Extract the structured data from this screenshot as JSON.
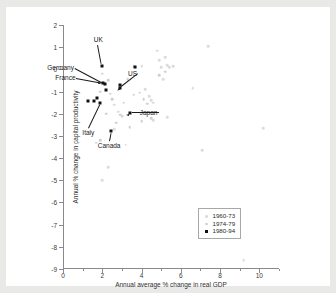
{
  "chart_data": {
    "type": "scatter",
    "title": "",
    "xlabel": "Annual average % change in real GDP",
    "ylabel": "Annual % change in capital productivity",
    "xlim": [
      0,
      11
    ],
    "ylim": [
      -9,
      2
    ],
    "xticks": [
      0,
      2,
      4,
      6,
      8,
      10
    ],
    "xticklabels": [
      "0",
      "2",
      "4",
      "6",
      "8",
      "10"
    ],
    "xminorticks": [
      1,
      3,
      5,
      7,
      9,
      11
    ],
    "yticks": [
      2,
      1,
      0,
      -1,
      -2,
      -3,
      -4,
      -5,
      -6,
      -7,
      -8,
      -9
    ],
    "yticklabels": [
      "2",
      "1",
      "0",
      "-1",
      "-2",
      "-3",
      "-4",
      "-5",
      "-6",
      "-7",
      "-8",
      "-9"
    ],
    "grid": false,
    "legend_position": "lower-right",
    "legend_entries": [
      "1960-73",
      "1974-79",
      "1980-94"
    ],
    "colors": {
      "series_1960_73": "#dcdcdc",
      "series_1974_79": "#cfcfcf",
      "series_1980_94": "#111111",
      "axis": "#8a8a8a",
      "page_background": "#e9e9e7",
      "plot_background": "#ffffff"
    },
    "series": [
      {
        "name": "1960-73",
        "marker": "circle-open-faint",
        "points": [
          [
            0.8,
            -3.3
          ],
          [
            1.7,
            -3.3
          ],
          [
            2.0,
            -5.0
          ],
          [
            2.3,
            -4.4
          ],
          [
            2.6,
            -2.7
          ],
          [
            2.0,
            -0.2
          ],
          [
            2.4,
            -1.1
          ],
          [
            2.6,
            -1.6
          ],
          [
            2.8,
            -1.9
          ],
          [
            3.0,
            -2.1
          ],
          [
            3.2,
            -3.4
          ],
          [
            3.6,
            0.15
          ],
          [
            3.7,
            0.1
          ],
          [
            4.0,
            0.15
          ],
          [
            4.4,
            -1.2
          ],
          [
            4.2,
            -0.9
          ],
          [
            4.5,
            -1.4
          ],
          [
            4.6,
            -1.5
          ],
          [
            4.8,
            0.85
          ],
          [
            4.9,
            0.4
          ],
          [
            5.0,
            0.1
          ],
          [
            5.2,
            0.55
          ],
          [
            5.3,
            0.2
          ],
          [
            5.4,
            0.1
          ],
          [
            5.6,
            0.15
          ],
          [
            5.1,
            -0.45
          ],
          [
            5.3,
            -2.15
          ],
          [
            4.6,
            -2.3
          ],
          [
            6.6,
            -0.85
          ],
          [
            7.4,
            1.05
          ],
          [
            7.1,
            -3.65
          ],
          [
            9.2,
            -8.6
          ],
          [
            10.2,
            -2.65
          ]
        ]
      },
      {
        "name": "1974-79",
        "marker": "circle-open-light",
        "points": [
          [
            1.9,
            -3.2
          ],
          [
            2.2,
            -2.0
          ],
          [
            2.5,
            -1.35
          ],
          [
            2.7,
            -2.4
          ],
          [
            2.9,
            -2.05
          ],
          [
            3.1,
            -1.5
          ],
          [
            3.3,
            -0.45
          ],
          [
            3.6,
            -1.15
          ],
          [
            3.9,
            -1.05
          ],
          [
            4.1,
            -1.35
          ],
          [
            4.3,
            -1.55
          ],
          [
            4.0,
            -2.35
          ],
          [
            4.5,
            -2.2
          ],
          [
            4.9,
            -0.25
          ],
          [
            5.2,
            -0.1
          ],
          [
            3.4,
            -2.6
          ],
          [
            2.3,
            -0.5
          ],
          [
            1.9,
            -1.0
          ]
        ]
      },
      {
        "name": "1980-94",
        "marker": "filled-square",
        "points": [
          [
            2.0,
            0.15
          ],
          [
            2.05,
            -0.62
          ],
          [
            2.15,
            -0.68
          ],
          [
            2.2,
            -0.95
          ],
          [
            1.9,
            -1.52
          ],
          [
            1.25,
            -1.42
          ],
          [
            1.6,
            -1.43
          ],
          [
            1.75,
            -1.3
          ],
          [
            2.9,
            -0.85
          ],
          [
            2.9,
            -0.72
          ],
          [
            3.4,
            -1.95
          ],
          [
            2.45,
            -2.8
          ],
          [
            3.65,
            0.12
          ]
        ]
      }
    ],
    "annotations": [
      {
        "label": "UK",
        "x": 2.0,
        "y": 0.15
      },
      {
        "label": "Germany",
        "x": 2.15,
        "y": -0.68
      },
      {
        "label": "France",
        "x": 2.05,
        "y": -0.62
      },
      {
        "label": "US",
        "x": 2.9,
        "y": -0.85
      },
      {
        "label": "Italy",
        "x": 1.9,
        "y": -1.52
      },
      {
        "label": "Japan",
        "x": 3.4,
        "y": -1.95
      },
      {
        "label": "Canada",
        "x": 2.45,
        "y": -2.8
      }
    ]
  },
  "axes": {
    "xlabel": "Annual average % change in real GDP",
    "ylabel": "Annual % change in capital productivity"
  },
  "legend": {
    "items": [
      {
        "label": "1960-73"
      },
      {
        "label": "1974-79"
      },
      {
        "label": "1980-94"
      }
    ]
  },
  "annotations": {
    "uk": "UK",
    "germany": "Germany",
    "france": "France",
    "us": "US",
    "italy": "Italy",
    "japan": "Japan",
    "canada": "Canada"
  }
}
